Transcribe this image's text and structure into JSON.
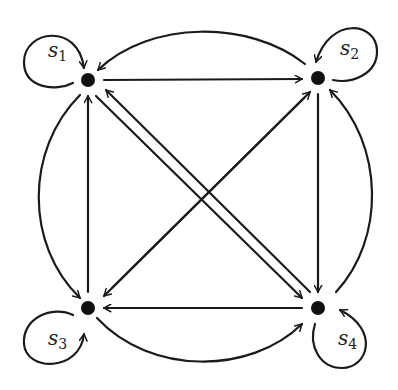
{
  "diagram": {
    "type": "state-transition-graph",
    "colors": {
      "stroke": "#1a1a1a",
      "node": "#111111",
      "background": "#ffffff"
    },
    "nodes": [
      {
        "id": "s1",
        "label": "s",
        "subscript": "1",
        "x": 88,
        "y": 80
      },
      {
        "id": "s2",
        "label": "s",
        "subscript": "2",
        "x": 318,
        "y": 78
      },
      {
        "id": "s3",
        "label": "s",
        "subscript": "3",
        "x": 88,
        "y": 308
      },
      {
        "id": "s4",
        "label": "s",
        "subscript": "4",
        "x": 318,
        "y": 308
      }
    ],
    "edges": [
      {
        "from": "s1",
        "to": "s1",
        "kind": "self-loop"
      },
      {
        "from": "s2",
        "to": "s2",
        "kind": "self-loop"
      },
      {
        "from": "s3",
        "to": "s3",
        "kind": "self-loop"
      },
      {
        "from": "s4",
        "to": "s4",
        "kind": "self-loop"
      },
      {
        "from": "s1",
        "to": "s2",
        "kind": "straight"
      },
      {
        "from": "s2",
        "to": "s1",
        "kind": "arc"
      },
      {
        "from": "s3",
        "to": "s1",
        "kind": "straight"
      },
      {
        "from": "s1",
        "to": "s3",
        "kind": "arc"
      },
      {
        "from": "s2",
        "to": "s4",
        "kind": "straight"
      },
      {
        "from": "s4",
        "to": "s2",
        "kind": "arc"
      },
      {
        "from": "s4",
        "to": "s3",
        "kind": "straight"
      },
      {
        "from": "s3",
        "to": "s4",
        "kind": "arc"
      },
      {
        "from": "s1",
        "to": "s4",
        "kind": "diagonal"
      },
      {
        "from": "s4",
        "to": "s1",
        "kind": "diagonal"
      },
      {
        "from": "s2",
        "to": "s3",
        "kind": "diagonal"
      },
      {
        "from": "s3",
        "to": "s2",
        "kind": "diagonal"
      }
    ]
  }
}
